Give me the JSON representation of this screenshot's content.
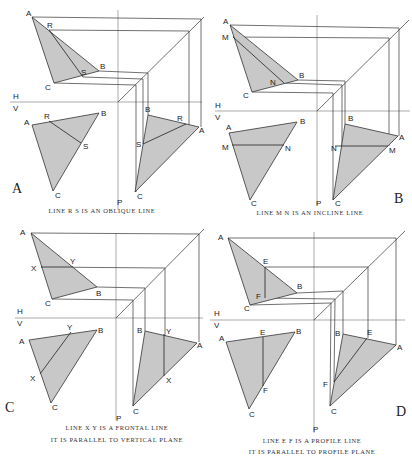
{
  "panels": [
    {
      "id": "A",
      "label": "A",
      "caption": [
        "LINE  R S  IS  AN  OBLIQUE  LINE"
      ],
      "line_type": "oblique",
      "axis_labels": {
        "h": "H",
        "v": "V",
        "p": "P"
      },
      "top_view": {
        "points": {
          "A": "A",
          "B": "B",
          "C": "C",
          "R": "R",
          "S": "S"
        }
      },
      "front_view": {
        "points": {
          "A": "A",
          "B": "B",
          "C": "C",
          "R": "R",
          "S": "S"
        }
      },
      "side_view": {
        "points": {
          "A": "A",
          "B": "B",
          "C": "C",
          "R": "R",
          "S": "S"
        }
      }
    },
    {
      "id": "B",
      "label": "B",
      "caption": [
        "LINE  M N  IS  AN  INCLINE  LINE"
      ],
      "line_type": "incline",
      "axis_labels": {
        "h": "H",
        "v": "V",
        "p": "P"
      },
      "top_view": {
        "points": {
          "A": "A",
          "B": "B",
          "C": "C",
          "M": "M",
          "N": "N"
        }
      },
      "front_view": {
        "points": {
          "A": "A",
          "B": "B",
          "C": "C",
          "M": "M",
          "N": "N"
        }
      },
      "side_view": {
        "points": {
          "A": "A",
          "B": "B",
          "C": "C",
          "M": "M",
          "N": "N"
        }
      }
    },
    {
      "id": "C",
      "label": "C",
      "caption": [
        "LINE  X Y  IS  A  FRONTAL  LINE",
        "IT  IS  PARALLEL  TO  VERTICAL  PLANE"
      ],
      "line_type": "frontal",
      "axis_labels": {
        "h": "H",
        "v": "V",
        "p": "P"
      },
      "top_view": {
        "points": {
          "A": "A",
          "B": "B",
          "C": "C",
          "X": "X",
          "Y": "Y"
        }
      },
      "front_view": {
        "points": {
          "A": "A",
          "B": "B",
          "C": "C",
          "X": "X",
          "Y": "Y"
        }
      },
      "side_view": {
        "points": {
          "A": "A",
          "B": "B",
          "C": "C",
          "X": "X",
          "Y": "Y"
        }
      }
    },
    {
      "id": "D",
      "label": "D",
      "caption": [
        "LINE  E F  IS  A  PROFILE  LINE",
        "IT  IS  PARALLEL  TO  PROFILE  PLANE"
      ],
      "line_type": "profile",
      "axis_labels": {
        "h": "H",
        "v": "V",
        "p": "P"
      },
      "top_view": {
        "points": {
          "A": "A",
          "B": "B",
          "C": "C",
          "E": "E",
          "F": "F"
        }
      },
      "front_view": {
        "points": {
          "A": "A",
          "B": "B",
          "C": "C",
          "E": "E",
          "F": "F"
        }
      },
      "side_view": {
        "points": {
          "A": "A",
          "B": "B",
          "C": "C",
          "E": "E",
          "F": "F"
        }
      }
    }
  ],
  "colors": {
    "fill": "#c8c8c8",
    "stroke": "#333333",
    "background": "#ffffff"
  }
}
